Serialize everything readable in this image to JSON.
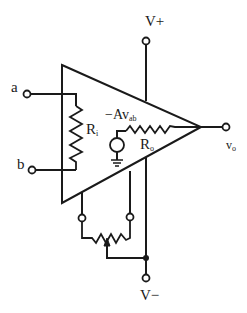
{
  "diagram": {
    "type": "circuit-schematic",
    "labels": {
      "v_plus": "V+",
      "v_minus": "V−",
      "input_a": "a",
      "input_b": "b",
      "input_resistor": "R",
      "input_resistor_sub": "i",
      "output_resistor": "R",
      "output_resistor_sub": "o",
      "source_prefix": "−Av",
      "source_sub": "ab",
      "output": "v",
      "output_sub": "o"
    },
    "components": [
      {
        "id": "opamp-triangle",
        "kind": "amplifier"
      },
      {
        "id": "Ri",
        "kind": "resistor",
        "between": [
          "a",
          "b"
        ]
      },
      {
        "id": "dependent-source",
        "kind": "voltage-source",
        "value": "-Av_ab"
      },
      {
        "id": "Ro",
        "kind": "resistor",
        "between": [
          "dependent-source",
          "vo"
        ]
      },
      {
        "id": "offset-pot",
        "kind": "potentiometer",
        "wiper_to": "V-"
      }
    ],
    "colors": {
      "stroke": "#1a1a1a",
      "background": "#ffffff"
    }
  }
}
